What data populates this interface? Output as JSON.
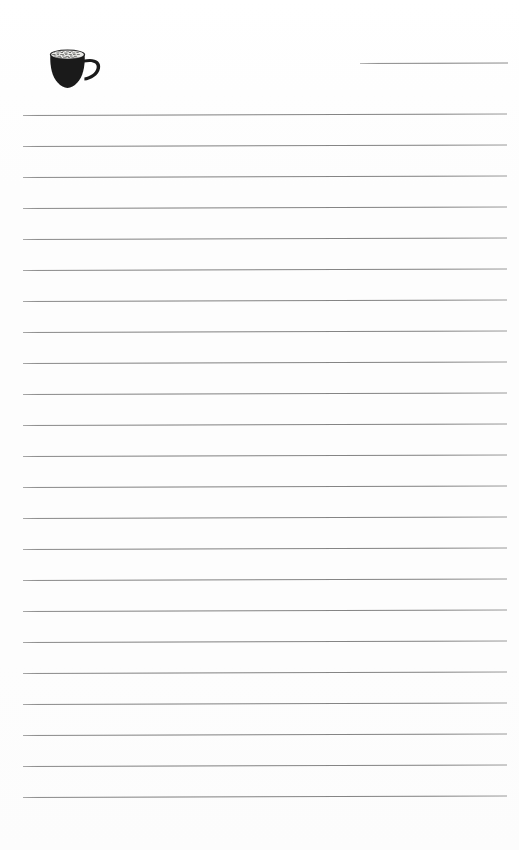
{
  "page": {
    "kind": "lined-notepaper-sheet",
    "width": 519,
    "height": 850,
    "background_color": "#fdfdfd",
    "text_content": "",
    "notes_written": "none"
  },
  "header": {
    "illustration": {
      "icon_name": "coffee-cup-icon",
      "description": "filled dark coffee cup with speckled crema surface and open side handle",
      "fill_color": "#1a1a1a",
      "crema_color": "#e8e8e6",
      "x": 47,
      "y": 47,
      "width": 62,
      "height": 48
    },
    "blank_rule": {
      "label": "",
      "color": "#8d8d8d",
      "x": 360,
      "y": 63,
      "width": 148
    }
  },
  "body": {
    "ruled_lines": {
      "count": 23,
      "first_line_y": 115,
      "spacing": 31,
      "left_x": 23,
      "width": 484,
      "color": "#828282",
      "slant_degrees": -0.18
    },
    "line_values": [
      "",
      "",
      "",
      "",
      "",
      "",
      "",
      "",
      "",
      "",
      "",
      "",
      "",
      "",
      "",
      "",
      "",
      "",
      "",
      "",
      "",
      "",
      ""
    ]
  }
}
